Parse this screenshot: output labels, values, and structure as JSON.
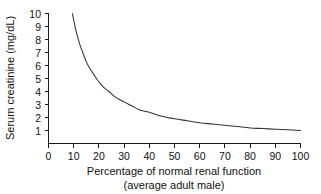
{
  "chart_data": {
    "type": "line",
    "title": "",
    "subtitle": "",
    "xlabel": "Percentage of normal renal function",
    "xlabel_line2": "(average adult male)",
    "ylabel": "Serum creatinine (mg/dL)",
    "xlim": [
      0,
      100
    ],
    "ylim": [
      0,
      10
    ],
    "grid": false,
    "legend": false,
    "legend_position": "none",
    "line_color": "#333333",
    "axis_color": "#1a1a1a",
    "background_color": "#ffffff",
    "xticks": [
      0,
      10,
      20,
      30,
      40,
      50,
      60,
      70,
      80,
      90,
      100
    ],
    "xticklabels": [
      "0",
      "10",
      "20",
      "30",
      "40",
      "50",
      "60",
      "70",
      "80",
      "90",
      "100"
    ],
    "yticks": [
      0,
      1,
      2,
      3,
      4,
      5,
      6,
      7,
      8,
      9,
      10
    ],
    "yticklabels": [
      "0",
      "1",
      "2",
      "3",
      "4",
      "5",
      "6",
      "7",
      "8",
      "9",
      "10"
    ],
    "relation": "serum creatinine is inversely proportional to percentage of normal renal function (approximately y = 95 / x)",
    "series": [
      {
        "name": "Serum creatinine vs renal function",
        "x": [
          9.5,
          10,
          11,
          12,
          13,
          14,
          15,
          16,
          17,
          18,
          19,
          20,
          22,
          24,
          26,
          28,
          30,
          33,
          36,
          40,
          45,
          50,
          55,
          60,
          65,
          70,
          75,
          80,
          85,
          90,
          95,
          100
        ],
        "y": [
          10.0,
          9.5,
          8.6,
          7.9,
          7.3,
          6.8,
          6.3,
          5.9,
          5.6,
          5.3,
          5.0,
          4.75,
          4.3,
          4.0,
          3.65,
          3.4,
          3.2,
          2.9,
          2.6,
          2.4,
          2.1,
          1.9,
          1.75,
          1.6,
          1.5,
          1.4,
          1.3,
          1.2,
          1.15,
          1.1,
          1.05,
          1.0
        ]
      }
    ]
  },
  "axes": {
    "y_title": "Serum creatinine (mg/dL)",
    "x_title": "Percentage of normal renal function",
    "x_title_line2": "(average adult male)"
  }
}
